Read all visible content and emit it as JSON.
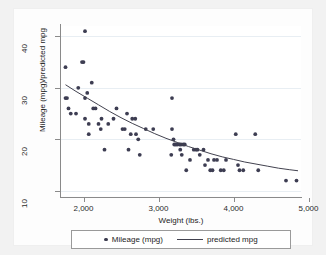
{
  "chart_data": {
    "type": "scatter",
    "title": "",
    "xlabel": "Weight (lbs.)",
    "ylabel": "Mileage (mpg)/predicted mpg",
    "xlim": [
      1700,
      4900
    ],
    "ylim": [
      9,
      42
    ],
    "xticks": [
      2000,
      3000,
      4000,
      5000
    ],
    "xticklabels": [
      "2,000",
      "3,000",
      "4,000",
      "5,000"
    ],
    "yticks": [
      10,
      20,
      30,
      40
    ],
    "yticklabels": [
      "10",
      "20",
      "30",
      "40"
    ],
    "grid": "horizontal",
    "legend_position": "bottom",
    "series": [
      {
        "name": "Mileage (mpg)",
        "type": "scatter",
        "marker": "circle",
        "color": "#3d3d52",
        "points": [
          [
            1760,
            28
          ],
          [
            1780,
            28
          ],
          [
            1760,
            34
          ],
          [
            1800,
            26
          ],
          [
            1830,
            25
          ],
          [
            1900,
            25
          ],
          [
            1930,
            30
          ],
          [
            1980,
            35
          ],
          [
            2000,
            35
          ],
          [
            2020,
            41
          ],
          [
            2020,
            24
          ],
          [
            2020,
            28
          ],
          [
            2050,
            29
          ],
          [
            2070,
            23
          ],
          [
            2070,
            21
          ],
          [
            2110,
            31
          ],
          [
            2130,
            26
          ],
          [
            2160,
            26
          ],
          [
            2200,
            23
          ],
          [
            2230,
            22
          ],
          [
            2240,
            24
          ],
          [
            2280,
            18
          ],
          [
            2330,
            23
          ],
          [
            2400,
            24
          ],
          [
            2440,
            26
          ],
          [
            2520,
            22
          ],
          [
            2550,
            22
          ],
          [
            2580,
            25
          ],
          [
            2600,
            18
          ],
          [
            2630,
            21
          ],
          [
            2650,
            24
          ],
          [
            2690,
            24
          ],
          [
            2700,
            21
          ],
          [
            2730,
            20
          ],
          [
            2750,
            17
          ],
          [
            2830,
            22
          ],
          [
            2930,
            22
          ],
          [
            3170,
            17
          ],
          [
            3180,
            28
          ],
          [
            3180,
            22
          ],
          [
            3200,
            20
          ],
          [
            3210,
            19
          ],
          [
            3230,
            19
          ],
          [
            3250,
            19
          ],
          [
            3280,
            19
          ],
          [
            3290,
            18
          ],
          [
            3300,
            19
          ],
          [
            3310,
            17
          ],
          [
            3330,
            19
          ],
          [
            3350,
            19
          ],
          [
            3370,
            14
          ],
          [
            3420,
            16
          ],
          [
            3470,
            18
          ],
          [
            3500,
            18
          ],
          [
            3520,
            18
          ],
          [
            3550,
            17
          ],
          [
            3600,
            18
          ],
          [
            3620,
            15
          ],
          [
            3660,
            16
          ],
          [
            3690,
            14
          ],
          [
            3720,
            14
          ],
          [
            3740,
            16
          ],
          [
            3780,
            16
          ],
          [
            3830,
            14
          ],
          [
            3870,
            14
          ],
          [
            3900,
            16
          ],
          [
            4030,
            21
          ],
          [
            4060,
            15
          ],
          [
            4080,
            14
          ],
          [
            4130,
            14
          ],
          [
            4290,
            21
          ],
          [
            4330,
            14
          ],
          [
            4700,
            12
          ],
          [
            4840,
            12
          ]
        ]
      },
      {
        "name": "predicted mpg",
        "type": "line",
        "color": "#42424f",
        "points": [
          [
            1760,
            30.6
          ],
          [
            1900,
            29.3
          ],
          [
            2050,
            28.0
          ],
          [
            2200,
            26.7
          ],
          [
            2350,
            25.4
          ],
          [
            2500,
            24.2
          ],
          [
            2650,
            23.1
          ],
          [
            2800,
            22.1
          ],
          [
            2950,
            21.1
          ],
          [
            3100,
            20.2
          ],
          [
            3250,
            19.4
          ],
          [
            3400,
            18.6
          ],
          [
            3550,
            17.9
          ],
          [
            3700,
            17.2
          ],
          [
            3850,
            16.6
          ],
          [
            4000,
            16.1
          ],
          [
            4150,
            15.6
          ],
          [
            4300,
            15.2
          ],
          [
            4450,
            14.8
          ],
          [
            4600,
            14.4
          ],
          [
            4750,
            14.1
          ],
          [
            4860,
            13.9
          ]
        ]
      }
    ]
  },
  "legend": {
    "entries": [
      {
        "label": "Mileage (mpg)",
        "glyph": "marker-dot"
      },
      {
        "label": "predicted mpg",
        "glyph": "line-segment"
      }
    ]
  },
  "colors": {
    "marker": "#3d3d52",
    "line": "#42424f",
    "grid": "#e8eef3",
    "axis": "#8a8a8a",
    "plot_background": "#ffffff",
    "figure_background": "#f2f2f2"
  }
}
